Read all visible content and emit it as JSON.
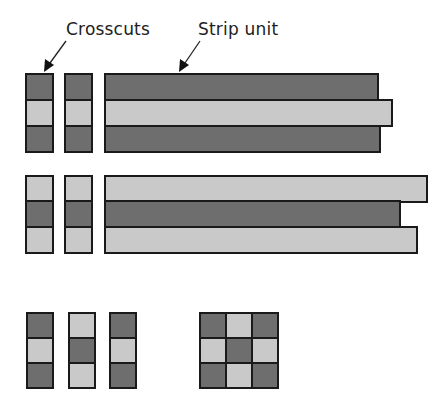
{
  "labels": {
    "crosscuts": "Crosscuts",
    "strip_unit": "Strip unit"
  },
  "colors": {
    "dark": "#6e6e6e",
    "light": "#c9c9c9",
    "border": "#1a1a1a"
  },
  "row1": {
    "pattern": [
      "dark",
      "light",
      "dark"
    ],
    "strip_ends": [
      379,
      393,
      381
    ]
  },
  "row2": {
    "pattern": [
      "light",
      "dark",
      "light"
    ],
    "strip_ends": [
      428,
      401,
      418
    ]
  },
  "bottom_columns": [
    [
      "dark",
      "light",
      "dark"
    ],
    [
      "light",
      "dark",
      "light"
    ],
    [
      "dark",
      "light",
      "dark"
    ]
  ],
  "nine_patch": [
    [
      "dark",
      "light",
      "dark"
    ],
    [
      "light",
      "dark",
      "light"
    ],
    [
      "dark",
      "light",
      "dark"
    ]
  ]
}
